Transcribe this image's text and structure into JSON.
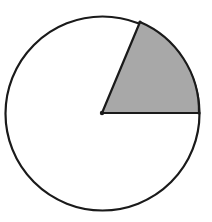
{
  "diagram": {
    "type": "circle-with-shaded-sector",
    "circle": {
      "cx": 102.5,
      "cy": 113.5,
      "r": 97,
      "stroke": "#1a1a1a",
      "fill": "#ffffff"
    },
    "center_point": {
      "x": 102,
      "y": 113
    },
    "sector": {
      "start_point": {
        "x": 199,
        "y": 113
      },
      "end_point": {
        "x": 140,
        "y": 22
      },
      "angle_degrees": 67,
      "fill": "#a8a8a8",
      "stroke": "#1a1a1a"
    },
    "points": [
      {
        "name": "center",
        "x": 102,
        "y": 113
      },
      {
        "name": "right-radius-end",
        "x": 199,
        "y": 113
      },
      {
        "name": "upper-radius-end",
        "x": 140,
        "y": 22
      }
    ]
  }
}
